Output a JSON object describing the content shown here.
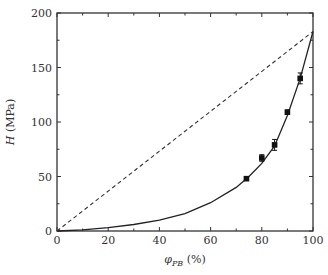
{
  "chart_data": {
    "type": "scatter",
    "title": "",
    "xlabel": "φ_PB (%)",
    "xlabel_main": "φ",
    "xlabel_sub": "PB",
    "xlabel_unit": " (%)",
    "ylabel": "H (MPa)",
    "ylabel_var": "H",
    "ylabel_unit": " (MPa)",
    "xlim": [
      0,
      100
    ],
    "ylim": [
      0,
      200
    ],
    "x_ticks": [
      0,
      20,
      40,
      60,
      80,
      100
    ],
    "y_ticks": [
      0,
      50,
      100,
      150,
      200
    ],
    "grid": false,
    "legend": null,
    "series": [
      {
        "name": "measured",
        "style": "black square markers with error bars",
        "x": [
          74,
          80,
          85,
          90,
          95
        ],
        "y": [
          48,
          67,
          79,
          109,
          140
        ],
        "yerr": [
          1.5,
          3,
          5,
          2,
          5
        ]
      },
      {
        "name": "fit curve",
        "style": "solid line",
        "x": [
          0,
          10,
          20,
          30,
          40,
          50,
          60,
          70,
          75,
          80,
          85,
          90,
          95,
          100
        ],
        "y": [
          0,
          1,
          3,
          6,
          10,
          16,
          26,
          40,
          50,
          62,
          78,
          106,
          140,
          183
        ]
      },
      {
        "name": "linear rule of mixtures",
        "style": "dashed line",
        "x": [
          0,
          100
        ],
        "y": [
          0,
          183
        ]
      }
    ]
  }
}
